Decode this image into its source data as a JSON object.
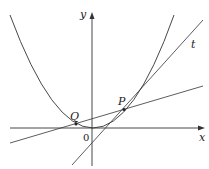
{
  "diagram": {
    "type": "math-plot",
    "labels": {
      "y_axis": "y",
      "x_axis": "x",
      "origin": "0",
      "point_p": "P",
      "point_q": "Q",
      "tangent": "t"
    },
    "elements": [
      {
        "name": "parabola",
        "description": "upward parabola with vertex near origin"
      },
      {
        "name": "tangent-line-t",
        "description": "tangent line at point P"
      },
      {
        "name": "secant-line-pq",
        "description": "line through Q and P"
      }
    ],
    "colors": {
      "stroke": "#333333",
      "background": "#ffffff"
    }
  }
}
